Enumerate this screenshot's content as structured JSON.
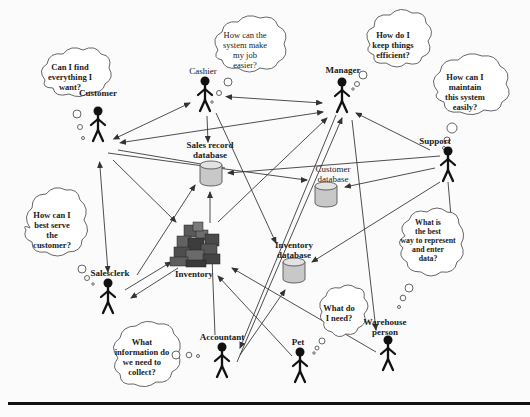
{
  "diagram": {
    "actors": [
      {
        "id": "customer",
        "label": "Customer"
      },
      {
        "id": "cashier",
        "label": "Cashier"
      },
      {
        "id": "manager",
        "label": "Manager"
      },
      {
        "id": "support",
        "label": "Support"
      },
      {
        "id": "salesclerk",
        "label": "Salesclerk"
      },
      {
        "id": "accountant",
        "label": "Accountant"
      },
      {
        "id": "pet",
        "label": "Pet"
      },
      {
        "id": "warehouse",
        "label": "Warehouse person"
      }
    ],
    "stores": [
      {
        "id": "sales_db",
        "label_line1": "Sales record",
        "label_line2": "database"
      },
      {
        "id": "customer_db",
        "label_line1": "Customer",
        "label_line2": "database"
      },
      {
        "id": "inventory_db",
        "label_line1": "Inventory",
        "label_line2": "database"
      }
    ],
    "inventory": {
      "label": "Inventory"
    },
    "thoughts": {
      "customer": [
        "Can I find",
        "everything I",
        "want?"
      ],
      "cashier": [
        "How can the",
        "system make",
        "my job",
        "easier?"
      ],
      "manager": [
        "How do I",
        "keep things",
        "efficient?"
      ],
      "support": [
        "How can I",
        "maintain",
        "this system",
        "easily?"
      ],
      "salesclerk": [
        "How can I",
        "best serve",
        "the",
        "customer?"
      ],
      "accountant": [
        "What",
        "information do",
        "we need to",
        "collect?"
      ],
      "warehouse": [
        "What is",
        "the best",
        "way to represent",
        "and enter",
        "data?"
      ],
      "pet": [
        "What do",
        "I need?"
      ]
    }
  }
}
